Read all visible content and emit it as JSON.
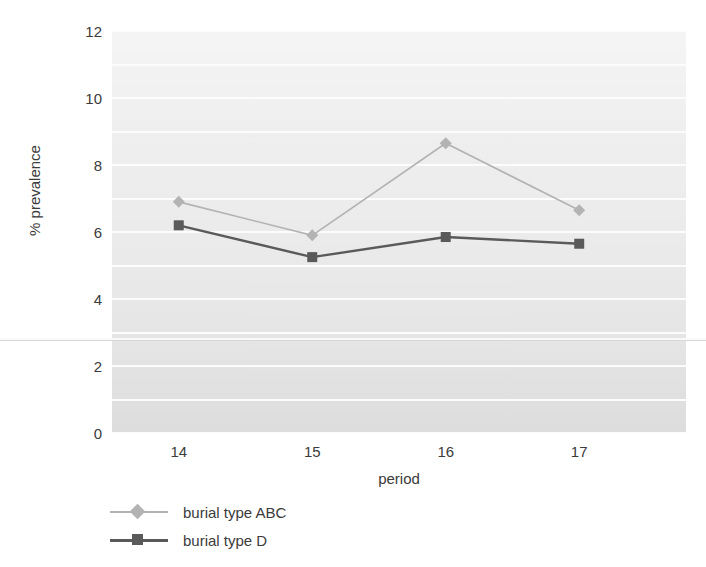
{
  "chart_data": {
    "type": "line",
    "title": "",
    "xlabel": "period",
    "ylabel": "% prevalence",
    "categories": [
      "14",
      "15",
      "16",
      "17"
    ],
    "x": [
      14,
      15,
      16,
      17
    ],
    "xlim": [
      13.5,
      17.8
    ],
    "ylim": [
      0,
      12
    ],
    "yticks": [
      0,
      2,
      4,
      6,
      8,
      10,
      12
    ],
    "ytick_labels": [
      "0",
      "2",
      "4",
      "6",
      "8",
      "10",
      "12"
    ],
    "minor_gridlines": true,
    "grid": true,
    "legend_position": "below-left",
    "series": [
      {
        "name": "burial type ABC",
        "marker": "diamond",
        "color": "#b3b3b3",
        "values": [
          6.9,
          5.9,
          8.65,
          6.65
        ]
      },
      {
        "name": "burial type D",
        "marker": "square",
        "color": "#5a5a5a",
        "values": [
          6.2,
          5.25,
          5.85,
          5.65
        ]
      }
    ]
  },
  "axes": {
    "y_title": "% prevalence",
    "x_title": "period",
    "y_ticks": [
      "12",
      "10",
      "8",
      "6",
      "4",
      "2",
      "0"
    ],
    "x_ticks": [
      "14",
      "15",
      "16",
      "17"
    ]
  },
  "legend": {
    "items": [
      {
        "label": "burial type ABC",
        "marker": "diamond",
        "color": "#b3b3b3"
      },
      {
        "label": "burial type D",
        "marker": "square",
        "color": "#5a5a5a"
      }
    ]
  },
  "colors": {
    "series_abc": "#b3b3b3",
    "series_d": "#5a5a5a",
    "plot_background": "#e8e8e8",
    "gridline": "#fcfcfc",
    "text": "#3b3b3b",
    "page_background": "#ffffff"
  }
}
